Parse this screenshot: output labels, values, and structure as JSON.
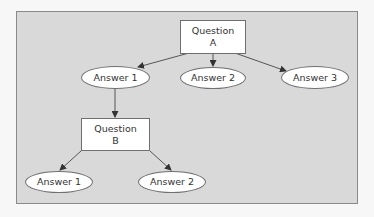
{
  "diagram": {
    "type": "decision-tree",
    "colors": {
      "panel_bg": "#d9d9d9",
      "panel_border": "#8a8a8a",
      "node_bg": "#ffffff",
      "edge": "#444444"
    },
    "nodes": {
      "question_a": {
        "line1": "Question",
        "line2": "A",
        "shape": "rectangle"
      },
      "a_answer_1": {
        "label": "Answer 1",
        "shape": "ellipse"
      },
      "a_answer_2": {
        "label": "Answer 2",
        "shape": "ellipse"
      },
      "a_answer_3": {
        "label": "Answer 3",
        "shape": "ellipse"
      },
      "question_b": {
        "line1": "Question",
        "line2": "B",
        "shape": "rectangle"
      },
      "b_answer_1": {
        "label": "Answer 1",
        "shape": "ellipse"
      },
      "b_answer_2": {
        "label": "Answer 2",
        "shape": "ellipse"
      }
    },
    "edges": [
      {
        "from": "question_a",
        "to": "a_answer_1"
      },
      {
        "from": "question_a",
        "to": "a_answer_2"
      },
      {
        "from": "question_a",
        "to": "a_answer_3"
      },
      {
        "from": "a_answer_1",
        "to": "question_b"
      },
      {
        "from": "question_b",
        "to": "b_answer_1"
      },
      {
        "from": "question_b",
        "to": "b_answer_2"
      }
    ]
  }
}
